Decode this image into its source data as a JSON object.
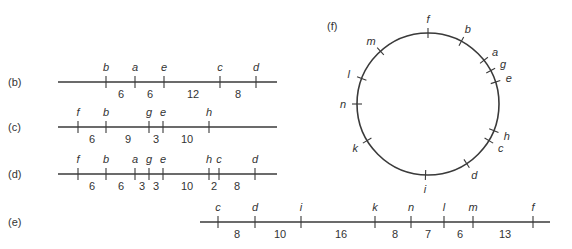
{
  "diagram": {
    "lines": [
      {
        "id": "b",
        "panel_label": "(b)",
        "y": 82,
        "x_start": 58,
        "x_end": 277,
        "label_x": 8,
        "ticks": [
          {
            "label": "b",
            "x": 106
          },
          {
            "label": "a",
            "x": 135
          },
          {
            "label": "e",
            "x": 164
          },
          {
            "label": "c",
            "x": 220
          },
          {
            "label": "d",
            "x": 256
          }
        ],
        "gaps": [
          {
            "value": "6",
            "x": 121
          },
          {
            "value": "6",
            "x": 150
          },
          {
            "value": "12",
            "x": 193
          },
          {
            "value": "8",
            "x": 238
          }
        ]
      },
      {
        "id": "c",
        "panel_label": "(c)",
        "y": 127,
        "x_start": 58,
        "x_end": 277,
        "label_x": 8,
        "ticks": [
          {
            "label": "f",
            "x": 78
          },
          {
            "label": "b",
            "x": 106
          },
          {
            "label": "g",
            "x": 149
          },
          {
            "label": "e",
            "x": 163
          },
          {
            "label": "h",
            "x": 209
          }
        ],
        "gaps": [
          {
            "value": "6",
            "x": 92
          },
          {
            "value": "9",
            "x": 128
          },
          {
            "value": "3",
            "x": 156
          },
          {
            "value": "10",
            "x": 187
          }
        ]
      },
      {
        "id": "d",
        "panel_label": "(d)",
        "y": 174,
        "x_start": 58,
        "x_end": 277,
        "label_x": 8,
        "ticks": [
          {
            "label": "f",
            "x": 78
          },
          {
            "label": "b",
            "x": 106
          },
          {
            "label": "a",
            "x": 135
          },
          {
            "label": "g",
            "x": 149
          },
          {
            "label": "e",
            "x": 163
          },
          {
            "label": "h",
            "x": 209
          },
          {
            "label": "c",
            "x": 219
          },
          {
            "label": "d",
            "x": 255
          }
        ],
        "gaps": [
          {
            "value": "6",
            "x": 92
          },
          {
            "value": "6",
            "x": 121
          },
          {
            "value": "3",
            "x": 142
          },
          {
            "value": "3",
            "x": 156
          },
          {
            "value": "10",
            "x": 187
          },
          {
            "value": "2",
            "x": 214
          },
          {
            "value": "8",
            "x": 237
          }
        ]
      },
      {
        "id": "e",
        "panel_label": "(e)",
        "y": 222,
        "x_start": 200,
        "x_end": 550,
        "label_x": 8,
        "ticks": [
          {
            "label": "c",
            "x": 218
          },
          {
            "label": "d",
            "x": 255
          },
          {
            "label": "i",
            "x": 301
          },
          {
            "label": "k",
            "x": 375
          },
          {
            "label": "n",
            "x": 411
          },
          {
            "label": "l",
            "x": 444
          },
          {
            "label": "m",
            "x": 473
          },
          {
            "label": "f",
            "x": 533
          }
        ],
        "gaps": [
          {
            "value": "8",
            "x": 237
          },
          {
            "value": "10",
            "x": 280
          },
          {
            "value": "16",
            "x": 341
          },
          {
            "value": "8",
            "x": 395
          },
          {
            "value": "7",
            "x": 428
          },
          {
            "value": "6",
            "x": 460
          },
          {
            "value": "13",
            "x": 505
          }
        ]
      }
    ],
    "circle": {
      "panel_label": "(f)",
      "label_x": 327,
      "label_y": 30,
      "cx": 428,
      "cy": 104,
      "r": 71,
      "ticks": [
        {
          "label": "f",
          "angle": 0
        },
        {
          "label": "b",
          "angle": 28
        },
        {
          "label": "a",
          "angle": 52
        },
        {
          "label": "g",
          "angle": 62
        },
        {
          "label": "e",
          "angle": 72
        },
        {
          "label": "h",
          "angle": 112
        },
        {
          "label": "c",
          "angle": 121
        },
        {
          "label": "d",
          "angle": 147
        },
        {
          "label": "i",
          "angle": 182
        },
        {
          "label": "k",
          "angle": 239
        },
        {
          "label": "n",
          "angle": 270
        },
        {
          "label": "l",
          "angle": 291
        },
        {
          "label": "m",
          "angle": 318
        }
      ]
    }
  },
  "colors": {
    "line": "#3a3a3a",
    "text": "#333333",
    "background": "#ffffff"
  }
}
